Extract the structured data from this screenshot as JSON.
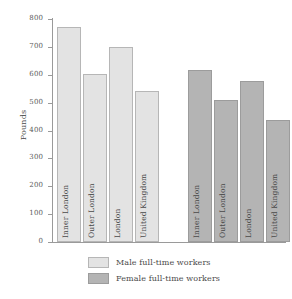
{
  "chart_data": {
    "type": "bar",
    "title": "",
    "subtitle": "",
    "xlabel": "",
    "ylabel": "Pounds",
    "ylim": [
      0,
      800
    ],
    "yticks": [
      0,
      100,
      200,
      300,
      400,
      500,
      600,
      700,
      800
    ],
    "ytick_labels": [
      "0",
      "100",
      "200",
      "300",
      "400",
      "500",
      "600",
      "700",
      "800"
    ],
    "grid": false,
    "legend_position": "bottom",
    "grouped": true,
    "categories": [
      "Inner London",
      "Outer London",
      "London",
      "United Kingdom"
    ],
    "series": [
      {
        "name": "Male full-time workers",
        "color": "#e3e3e3",
        "edge_color": "#b6b6b6",
        "values": [
          770,
          603,
          698,
          540
        ]
      },
      {
        "name": "Female full-time workers",
        "color": "#b4b4b4",
        "edge_color": "#9c9c9c",
        "values": [
          618,
          510,
          578,
          438
        ]
      }
    ],
    "bars": [
      {
        "group": "Male full-time workers",
        "category": "Inner London",
        "value": 770
      },
      {
        "group": "Male full-time workers",
        "category": "Outer London",
        "value": 603
      },
      {
        "group": "Male full-time workers",
        "category": "London",
        "value": 698
      },
      {
        "group": "Male full-time workers",
        "category": "United Kingdom",
        "value": 540
      },
      {
        "group": "Female full-time workers",
        "category": "Inner London",
        "value": 618
      },
      {
        "group": "Female full-time workers",
        "category": "Outer London",
        "value": 510
      },
      {
        "group": "Female full-time workers",
        "category": "London",
        "value": 578
      },
      {
        "group": "Female full-time workers",
        "category": "United Kingdom",
        "value": 438
      }
    ]
  },
  "axis": {
    "y_title": "Pounds",
    "tick_labels": [
      "800",
      "700",
      "600",
      "500",
      "400",
      "300",
      "200",
      "100",
      "0"
    ]
  },
  "bar_labels": [
    "Inner London",
    "Outer London",
    "London",
    "United Kingdom",
    "Inner London",
    "Outer London",
    "London",
    "United Kingdom"
  ],
  "legend": {
    "items": [
      {
        "label": "Male full-time workers",
        "swatch": "#e3e3e3"
      },
      {
        "label": "Female full-time workers",
        "swatch": "#b4b4b4"
      }
    ]
  },
  "colors": {
    "male": "#e3e3e3",
    "female": "#b4b4b4",
    "axis": "#9a9a9a",
    "text": "#4a4a4a",
    "background": "#ffffff"
  }
}
